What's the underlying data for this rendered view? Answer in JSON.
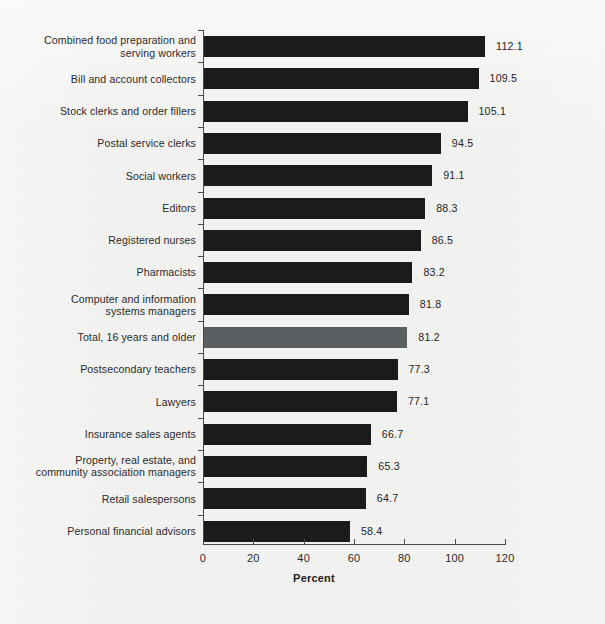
{
  "chart_data": {
    "type": "bar",
    "orientation": "horizontal",
    "title": "",
    "xlabel": "Percent",
    "ylabel": "",
    "xlim": [
      0,
      120
    ],
    "xticks": [
      "0",
      "20",
      "40",
      "60",
      "80",
      "100",
      "120"
    ],
    "grid": false,
    "legend": null,
    "highlight_category": "Total, 16 years and older",
    "colors": {
      "bar": "#1b1b1b",
      "highlight_bar": "#5a5f61",
      "background": "#f2f2f0",
      "axis": "#4a4a4a",
      "text": "#2b2b2b"
    },
    "categories": [
      "Combined food preparation and\nserving workers",
      "Bill and account collectors",
      "Stock clerks and order fillers",
      "Postal service clerks",
      "Social workers",
      "Editors",
      "Registered nurses",
      "Pharmacists",
      "Computer and information\nsystems managers",
      "Total, 16 years and older",
      "Postsecondary teachers",
      "Lawyers",
      "Insurance sales agents",
      "Property, real estate, and\ncommunity association managers",
      "Retail salespersons",
      "Personal financial advisors"
    ],
    "values": [
      112.1,
      109.5,
      105.1,
      94.5,
      91.1,
      88.3,
      86.5,
      83.2,
      81.8,
      81.2,
      77.3,
      77.1,
      66.7,
      65.3,
      64.7,
      58.4
    ],
    "value_labels": [
      "112.1",
      "109.5",
      "105.1",
      "94.5",
      "91.1",
      "88.3",
      "86.5",
      "83.2",
      "81.8",
      "81.2",
      "77.3",
      "77.1",
      "66.7",
      "65.3",
      "64.7",
      "58.4"
    ]
  }
}
